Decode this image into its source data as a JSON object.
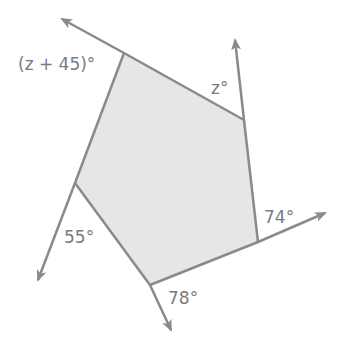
{
  "diagram": {
    "type": "pentagon-exterior-angles",
    "colors": {
      "fill": "#e6e6e6",
      "stroke": "#8a8a8a",
      "label": "#7a7a7a",
      "background": "#ffffff"
    },
    "vertices": [
      {
        "id": "A",
        "x": 124,
        "y": 53
      },
      {
        "id": "B",
        "x": 244,
        "y": 120
      },
      {
        "id": "C",
        "x": 258,
        "y": 242
      },
      {
        "id": "D",
        "x": 150,
        "y": 285
      },
      {
        "id": "E",
        "x": 75,
        "y": 183
      }
    ],
    "angle_labels": [
      {
        "id": "angle-A",
        "text": "(z + 45)°",
        "x": 18,
        "y": 70
      },
      {
        "id": "angle-B",
        "text": "z°",
        "x": 211,
        "y": 94
      },
      {
        "id": "angle-C",
        "text": "74°",
        "x": 264,
        "y": 223
      },
      {
        "id": "angle-D",
        "text": "78°",
        "x": 168,
        "y": 304
      },
      {
        "id": "angle-E",
        "text": "55°",
        "x": 64,
        "y": 243
      }
    ]
  }
}
